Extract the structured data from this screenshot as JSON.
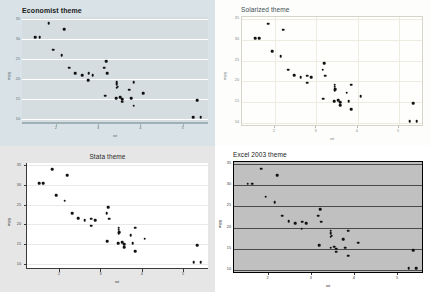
{
  "figure": {
    "layout": "2x2-grid",
    "width": 430,
    "height": 292,
    "background": "#ffffff"
  },
  "chart_data": [
    {
      "type": "scatter",
      "title": "Economist theme",
      "xlabel": "wt",
      "ylabel": "mpg",
      "xlim": [
        1.2,
        5.6
      ],
      "ylim": [
        9.0,
        35.5
      ],
      "xticks": [
        "2",
        "3",
        "4",
        "5"
      ],
      "xtick_values": [
        2,
        3,
        4,
        5
      ],
      "yticks": [
        "35",
        "30",
        "25",
        "20",
        "15",
        "10"
      ],
      "ytick_values": [
        35,
        30,
        25,
        20,
        15,
        10
      ],
      "grid": "horizontal",
      "grid_color": "#ffffff",
      "panel_bg": "#d5dde1",
      "plot_bg": "#d9e2e6",
      "point_color": "#111111",
      "legend": "none",
      "x": [
        2.62,
        2.875,
        2.32,
        3.215,
        3.44,
        3.46,
        3.57,
        3.19,
        3.15,
        3.44,
        3.44,
        4.07,
        3.73,
        3.78,
        5.25,
        5.424,
        5.345,
        2.2,
        1.615,
        1.835,
        2.465,
        3.52,
        3.435,
        3.84,
        3.845,
        1.935,
        2.14,
        1.513,
        3.17,
        2.77,
        3.57,
        2.78
      ],
      "y": [
        21.0,
        21.0,
        22.8,
        21.4,
        18.7,
        18.1,
        14.3,
        24.4,
        22.8,
        19.2,
        17.8,
        16.4,
        17.3,
        15.2,
        10.4,
        10.4,
        14.7,
        32.4,
        30.4,
        33.9,
        21.5,
        15.5,
        15.2,
        13.3,
        19.2,
        27.3,
        26.0,
        30.4,
        15.8,
        19.7,
        15.0,
        21.4
      ]
    },
    {
      "type": "scatter",
      "title": "Solarized theme",
      "xlabel": "wt",
      "ylabel": "mpg",
      "xlim": [
        1.2,
        5.6
      ],
      "ylim": [
        9.0,
        35.5
      ],
      "xticks": [
        "2",
        "3",
        "4",
        "5"
      ],
      "xtick_values": [
        2,
        3,
        4,
        5
      ],
      "yticks": [
        "35",
        "30",
        "25",
        "20",
        "15",
        "10"
      ],
      "ytick_values": [
        35,
        30,
        25,
        20,
        15,
        10
      ],
      "grid": "both",
      "grid_color": "#eeebe1",
      "panel_bg": "#fefefc",
      "plot_bg": "#fdfdfb",
      "point_color": "#111111",
      "legend": "none",
      "x": [
        2.62,
        2.875,
        2.32,
        3.215,
        3.44,
        3.46,
        3.57,
        3.19,
        3.15,
        3.44,
        3.44,
        4.07,
        3.73,
        3.78,
        5.25,
        5.424,
        5.345,
        2.2,
        1.615,
        1.835,
        2.465,
        3.52,
        3.435,
        3.84,
        3.845,
        1.935,
        2.14,
        1.513,
        3.17,
        2.77,
        3.57,
        2.78
      ],
      "y": [
        21.0,
        21.0,
        22.8,
        21.4,
        18.7,
        18.1,
        14.3,
        24.4,
        22.8,
        19.2,
        17.8,
        16.4,
        17.3,
        15.2,
        10.4,
        10.4,
        14.7,
        32.4,
        30.4,
        33.9,
        21.5,
        15.5,
        15.2,
        13.3,
        19.2,
        27.3,
        26.0,
        30.4,
        15.8,
        19.7,
        15.0,
        21.4
      ]
    },
    {
      "type": "scatter",
      "title": "Stata theme",
      "xlabel": "wt",
      "ylabel": "mpg",
      "xlim": [
        1.2,
        5.6
      ],
      "ylim": [
        9.0,
        35.5
      ],
      "xticks": [
        "2",
        "3",
        "4",
        "5"
      ],
      "xtick_values": [
        2,
        3,
        4,
        5
      ],
      "yticks": [
        "35",
        "30",
        "25",
        "20",
        "15",
        "10"
      ],
      "ytick_values": [
        35,
        30,
        25,
        20,
        15,
        10
      ],
      "grid": "horizontal",
      "grid_color": "#e9e9e9",
      "panel_bg": "#ffffff",
      "plot_bg": "#e6e6e6",
      "point_color": "#111111",
      "legend": "none",
      "x": [
        2.62,
        2.875,
        2.32,
        3.215,
        3.44,
        3.46,
        3.57,
        3.19,
        3.15,
        3.44,
        3.44,
        4.07,
        3.73,
        3.78,
        5.25,
        5.424,
        5.345,
        2.2,
        1.615,
        1.835,
        2.465,
        3.52,
        3.435,
        3.84,
        3.845,
        1.935,
        2.14,
        1.513,
        3.17,
        2.77,
        3.57,
        2.78
      ],
      "y": [
        21.0,
        21.0,
        22.8,
        21.4,
        18.7,
        18.1,
        14.3,
        24.4,
        22.8,
        19.2,
        17.8,
        16.4,
        17.3,
        15.2,
        10.4,
        10.4,
        14.7,
        32.4,
        30.4,
        33.9,
        21.5,
        15.5,
        15.2,
        13.3,
        19.2,
        27.3,
        26.0,
        30.4,
        15.8,
        19.7,
        15.0,
        21.4
      ]
    },
    {
      "type": "scatter",
      "title": "Excel 2003 theme",
      "xlabel": "wt",
      "ylabel": "mpg",
      "xlim": [
        1.2,
        5.6
      ],
      "ylim": [
        9.0,
        35.5
      ],
      "xticks": [
        "2",
        "3",
        "4",
        "5"
      ],
      "xtick_values": [
        2,
        3,
        4,
        5
      ],
      "yticks": [
        "35",
        "30",
        "25",
        "20",
        "15",
        "10"
      ],
      "ytick_values": [
        35,
        30,
        25,
        20,
        15,
        10
      ],
      "grid": "horizontal",
      "grid_color": "#4a4a4a",
      "panel_bg": "#c0c0c0",
      "plot_bg": "#ffffff",
      "point_color": "#111111",
      "legend": "none",
      "x": [
        2.62,
        2.875,
        2.32,
        3.215,
        3.44,
        3.46,
        3.57,
        3.19,
        3.15,
        3.44,
        3.44,
        4.07,
        3.73,
        3.78,
        5.25,
        5.424,
        5.345,
        2.2,
        1.615,
        1.835,
        2.465,
        3.52,
        3.435,
        3.84,
        3.845,
        1.935,
        2.14,
        1.513,
        3.17,
        2.77,
        3.57,
        2.78
      ],
      "y": [
        21.0,
        21.0,
        22.8,
        21.4,
        18.7,
        18.1,
        14.3,
        24.4,
        22.8,
        19.2,
        17.8,
        16.4,
        17.3,
        15.2,
        10.4,
        10.4,
        14.7,
        32.4,
        30.4,
        33.9,
        21.5,
        15.5,
        15.2,
        13.3,
        19.2,
        27.3,
        26.0,
        30.4,
        15.8,
        19.7,
        15.0,
        21.4
      ]
    }
  ]
}
